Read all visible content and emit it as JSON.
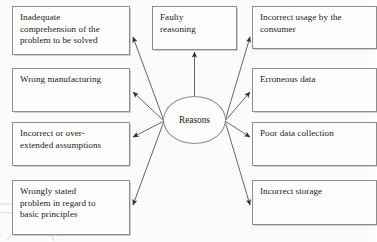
{
  "diagram": {
    "type": "cause-effect-fan",
    "center": {
      "label": "Reasons",
      "shape": "ellipse",
      "cx": 194.5,
      "cy": 120,
      "rx": 31.5,
      "ry": 24
    },
    "style": {
      "background_color": "#fbfbfa",
      "box_fill": "#fdfdfc",
      "box_border_color": "#8d8d8d",
      "line_color": "#4a4a4a",
      "text_color": "#1b1b1b"
    },
    "nodes": [
      {
        "id": "inadequate-comprehension",
        "label": "Inadequate\ncomprehension of the\nproblem to be solved",
        "column": "left",
        "x": 12,
        "y": 6,
        "w": 118,
        "h": 49,
        "arrow": {
          "x1": 164,
          "y1": 121,
          "x2": 133,
          "y2": 37
        }
      },
      {
        "id": "wrong-manufacturing",
        "label": "Wrong manufacturing",
        "column": "left",
        "x": 12,
        "y": 68,
        "w": 118,
        "h": 44,
        "arrow": {
          "x1": 164,
          "y1": 121,
          "x2": 133,
          "y2": 92
        }
      },
      {
        "id": "incorrect-overextended-assumptions",
        "label": "Incorrect or over-\nextended assumptions",
        "column": "left",
        "x": 12,
        "y": 122,
        "w": 118,
        "h": 44,
        "arrow": {
          "x1": 164,
          "y1": 121,
          "x2": 133,
          "y2": 137
        }
      },
      {
        "id": "wrongly-stated-problem",
        "label": "Wrongly stated\nproblem in regard to\nbasic principles",
        "column": "left",
        "x": 12,
        "y": 180,
        "w": 118,
        "h": 55,
        "arrow": {
          "x1": 164,
          "y1": 121,
          "x2": 133,
          "y2": 205
        }
      },
      {
        "id": "faulty-reasoning",
        "label": "Faulty\nreasoning",
        "column": "top",
        "x": 152,
        "y": 6,
        "w": 85,
        "h": 44,
        "arrow": {
          "x1": 194.5,
          "y1": 96,
          "x2": 194.5,
          "y2": 52
        }
      },
      {
        "id": "incorrect-usage-consumer",
        "label": "Incorrect usage by the\nconsumer",
        "column": "right",
        "x": 252,
        "y": 6,
        "w": 125,
        "h": 43,
        "arrow": {
          "x1": 225,
          "y1": 121,
          "x2": 250,
          "y2": 37
        }
      },
      {
        "id": "erroneous-data",
        "label": "Erroneous data",
        "column": "right",
        "x": 252,
        "y": 68,
        "w": 125,
        "h": 44,
        "arrow": {
          "x1": 225,
          "y1": 121,
          "x2": 250,
          "y2": 92
        }
      },
      {
        "id": "poor-data-collection",
        "label": "Poor data collection",
        "column": "right",
        "x": 252,
        "y": 122,
        "w": 125,
        "h": 44,
        "arrow": {
          "x1": 225,
          "y1": 121,
          "x2": 250,
          "y2": 137
        }
      },
      {
        "id": "incorrect-storage",
        "label": "Incorrect storage",
        "column": "right",
        "x": 252,
        "y": 180,
        "w": 125,
        "h": 45,
        "arrow": {
          "x1": 225,
          "y1": 121,
          "x2": 250,
          "y2": 205
        }
      }
    ]
  }
}
